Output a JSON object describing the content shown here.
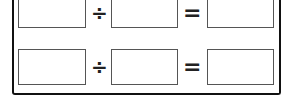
{
  "worksheet": {
    "rows": [
      {
        "dividend": "",
        "operator": "÷",
        "divisor": "",
        "equals": "=",
        "quotient": ""
      },
      {
        "dividend": "",
        "operator": "÷",
        "divisor": "",
        "equals": "=",
        "quotient": ""
      }
    ]
  }
}
